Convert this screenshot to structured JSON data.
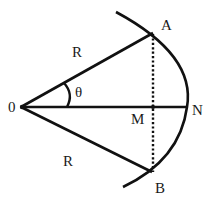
{
  "diagram": {
    "type": "geometry",
    "stroke_color": "#111111",
    "background": "#ffffff",
    "points": {
      "O": {
        "label": "0",
        "x": 21,
        "y": 107
      },
      "A": {
        "label": "A",
        "x": 153,
        "y": 33
      },
      "B": {
        "label": "B",
        "x": 153,
        "y": 172
      },
      "M": {
        "label": "M",
        "x": 153,
        "y": 107
      },
      "N": {
        "label": "N",
        "x": 187,
        "y": 107
      }
    },
    "labels": {
      "origin": "0",
      "point_a": "A",
      "point_b": "B",
      "point_m": "M",
      "point_n": "N",
      "radius_upper": "R",
      "radius_lower": "R",
      "angle": "θ"
    },
    "segments": [
      {
        "from": "O",
        "to": "A",
        "style": "solid",
        "label": "R"
      },
      {
        "from": "O",
        "to": "B",
        "style": "solid",
        "label": "R"
      },
      {
        "from": "O",
        "to": "N",
        "style": "solid"
      },
      {
        "from": "A",
        "to": "B",
        "style": "dotted"
      }
    ],
    "arc": {
      "through": [
        "A",
        "N",
        "B"
      ],
      "style": "solid"
    },
    "angle_marker": {
      "between": [
        "OA",
        "ON"
      ],
      "label": "θ"
    }
  }
}
